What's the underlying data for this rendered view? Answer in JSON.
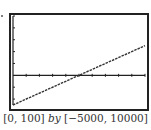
{
  "chart_data": {
    "type": "line",
    "title": "",
    "xlabel": "",
    "ylabel": "",
    "xlim": [
      0,
      100
    ],
    "ylim": [
      -5000,
      10000
    ],
    "xscale_tick": 10,
    "yscale_tick": 2000,
    "grid": false,
    "series": [
      {
        "name": "y = 100x - 5000",
        "x": [
          0,
          50,
          100
        ],
        "values": [
          -5000,
          0,
          5000
        ],
        "style": "dashed"
      }
    ],
    "window_caption": {
      "x_range": "[0, 100]",
      "by": "by",
      "y_range": "[−5000, 10000]"
    }
  },
  "colors": {
    "frame": "#222222",
    "line": "#333333",
    "axis": "#222222"
  }
}
